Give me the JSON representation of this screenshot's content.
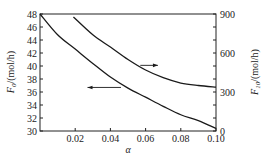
{
  "chart_data": {
    "type": "line",
    "title": "",
    "xlabel": "α",
    "ylabel_left": "F0/(mol/h)",
    "ylabel_right": "F10/(mol/h)",
    "xlim": [
      0,
      0.1
    ],
    "ylim_left": [
      30,
      48
    ],
    "ylim_right": [
      0,
      900
    ],
    "x_ticks": [
      "0.02",
      "0.04",
      "0.06",
      "0.08",
      "0.10"
    ],
    "y_left_ticks": [
      "30",
      "32",
      "34",
      "36",
      "38",
      "40",
      "42",
      "44",
      "46",
      "48"
    ],
    "y_right_ticks": [
      "0",
      "300",
      "600",
      "900"
    ],
    "grid": false,
    "legend": "arrows indicate axis: lower curve → left axis (F0), upper curve → right axis (F10)",
    "series": [
      {
        "name": "F0",
        "axis": "left",
        "x": [
          0.0,
          0.01,
          0.02,
          0.03,
          0.04,
          0.05,
          0.06,
          0.07,
          0.08,
          0.09,
          0.1
        ],
        "values": [
          48.0,
          44.8,
          42.6,
          40.4,
          38.3,
          36.6,
          35.2,
          33.8,
          32.5,
          31.6,
          30.4
        ]
      },
      {
        "name": "F10",
        "axis": "right",
        "x": [
          0.019,
          0.03,
          0.04,
          0.05,
          0.06,
          0.07,
          0.08,
          0.09,
          0.1
        ],
        "values": [
          877,
          740,
          646,
          550,
          469,
          410,
          369,
          350,
          338
        ]
      }
    ],
    "annotations": [
      {
        "type": "arrow",
        "direction": "left",
        "points_to": "left axis",
        "from_x": 0.046,
        "to_x": 0.027,
        "y_left": 36.7
      },
      {
        "type": "arrow",
        "direction": "right",
        "points_to": "right axis",
        "from_x": 0.057,
        "to_x": 0.067,
        "y_right": 505
      }
    ]
  },
  "labels": {
    "x_axis": "α",
    "y_left_main": "F",
    "y_left_sub": "0",
    "y_left_unit": "/(mol/h)",
    "y_right_main": "F",
    "y_right_sub": "10",
    "y_right_unit": "/(mol/h)"
  }
}
